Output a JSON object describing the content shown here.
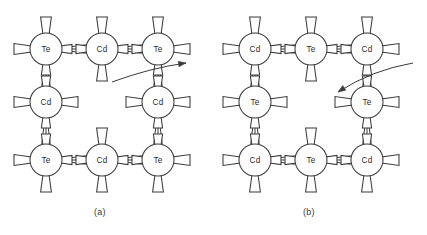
{
  "figure": {
    "background_color": "#ffffff",
    "line_color": "#3a3a3a",
    "label_color": "#2a2a2a",
    "width": 427,
    "height": 235
  },
  "panels": [
    {
      "id": "a",
      "caption": "(a)",
      "vacancy_present": true,
      "vacancy_position": {
        "row": 1,
        "col": 1
      },
      "atoms": [
        {
          "label": "Te",
          "cx": 46,
          "cy": 49,
          "r": 16,
          "row": 0,
          "col": 0
        },
        {
          "label": "Cd",
          "cx": 102,
          "cy": 49,
          "r": 16,
          "row": 0,
          "col": 1
        },
        {
          "label": "Te",
          "cx": 158,
          "cy": 49,
          "r": 16,
          "row": 0,
          "col": 2
        },
        {
          "label": "Cd",
          "cx": 46,
          "cy": 102,
          "r": 16,
          "row": 1,
          "col": 0
        },
        {
          "label": "Cd",
          "cx": 158,
          "cy": 102,
          "r": 16,
          "row": 1,
          "col": 2
        },
        {
          "label": "Te",
          "cx": 46,
          "cy": 160,
          "r": 16,
          "row": 2,
          "col": 0
        },
        {
          "label": "Cd",
          "cx": 102,
          "cy": 160,
          "r": 16,
          "row": 2,
          "col": 1
        },
        {
          "label": "Te",
          "cx": 158,
          "cy": 160,
          "r": 16,
          "row": 2,
          "col": 2
        }
      ],
      "bonds": [
        {
          "from": 0,
          "to": 1
        },
        {
          "from": 1,
          "to": 2
        },
        {
          "from": 0,
          "to": 3
        },
        {
          "from": 2,
          "to": 4
        },
        {
          "from": 3,
          "to": 5
        },
        {
          "from": 4,
          "to": 7
        },
        {
          "from": 5,
          "to": 6
        },
        {
          "from": 6,
          "to": 7
        }
      ],
      "arrow": {
        "direction": "right-up",
        "start_x": 112,
        "start_y": 82,
        "end_x": 186,
        "end_y": 63,
        "curve_x": 150,
        "curve_y": 68
      }
    },
    {
      "id": "b",
      "caption": "(b)",
      "vacancy_present": true,
      "vacancy_position": {
        "row": 1,
        "col": 1
      },
      "atoms": [
        {
          "label": "Cd",
          "cx": 255,
          "cy": 49,
          "r": 16,
          "row": 0,
          "col": 0
        },
        {
          "label": "Te",
          "cx": 311,
          "cy": 49,
          "r": 16,
          "row": 0,
          "col": 1
        },
        {
          "label": "Cd",
          "cx": 367,
          "cy": 49,
          "r": 16,
          "row": 0,
          "col": 2
        },
        {
          "label": "Te",
          "cx": 255,
          "cy": 102,
          "r": 16,
          "row": 1,
          "col": 0
        },
        {
          "label": "Te",
          "cx": 367,
          "cy": 102,
          "r": 16,
          "row": 1,
          "col": 2
        },
        {
          "label": "Cd",
          "cx": 255,
          "cy": 160,
          "r": 16,
          "row": 2,
          "col": 0
        },
        {
          "label": "Te",
          "cx": 311,
          "cy": 160,
          "r": 16,
          "row": 2,
          "col": 1
        },
        {
          "label": "Cd",
          "cx": 367,
          "cy": 160,
          "r": 16,
          "row": 2,
          "col": 2
        }
      ],
      "bonds": [
        {
          "from": 0,
          "to": 1
        },
        {
          "from": 1,
          "to": 2
        },
        {
          "from": 0,
          "to": 3
        },
        {
          "from": 2,
          "to": 4
        },
        {
          "from": 3,
          "to": 5
        },
        {
          "from": 4,
          "to": 7
        },
        {
          "from": 5,
          "to": 6
        },
        {
          "from": 6,
          "to": 7
        }
      ],
      "arrow": {
        "direction": "left-down",
        "start_x": 413,
        "start_y": 63,
        "end_x": 338,
        "end_y": 92,
        "curve_x": 372,
        "curve_y": 70
      }
    }
  ],
  "atom_species": {
    "Cd": "Cadmium",
    "Te": "Tellurium"
  }
}
